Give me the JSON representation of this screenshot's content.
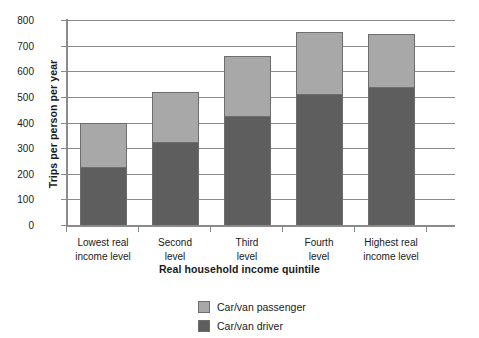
{
  "chart_data": {
    "type": "bar",
    "subtype": "stacked-vertical",
    "title": "",
    "xlabel": "Real household income quintile",
    "ylabel": "Trips per person per year",
    "ylim": [
      0,
      800
    ],
    "yticks": [
      0,
      100,
      200,
      300,
      400,
      500,
      600,
      700,
      800
    ],
    "ytick_labels": [
      "0",
      "100",
      "200",
      "300",
      "400",
      "500",
      "600",
      "700",
      "800"
    ],
    "grid": true,
    "legend_position": "bottom-center",
    "categories": [
      "Lowest real income level",
      "Second level",
      "Third level",
      "Fourth level",
      "Highest real income level"
    ],
    "category_lines": [
      [
        "Lowest real",
        "income level"
      ],
      [
        "Second",
        "level"
      ],
      [
        "Third",
        "level"
      ],
      [
        "Fourth",
        "level"
      ],
      [
        "Highest real",
        "income level"
      ]
    ],
    "series": [
      {
        "name": "Car/van driver",
        "color": "#5e5e5e",
        "values": [
          225,
          322,
          425,
          512,
          540
        ]
      },
      {
        "name": "Car/van passenger",
        "color": "#a8a8a8",
        "values": [
          175,
          198,
          235,
          240,
          207
        ]
      }
    ],
    "totals": [
      400,
      520,
      660,
      752,
      747
    ],
    "stack_order_bottom_to_top": [
      "Car/van driver",
      "Car/van passenger"
    ],
    "legend": [
      {
        "label": "Car/van passenger",
        "swatch": "light",
        "color": "#a8a8a8"
      },
      {
        "label": "Car/van driver",
        "swatch": "dark",
        "color": "#5e5e5e"
      }
    ]
  }
}
